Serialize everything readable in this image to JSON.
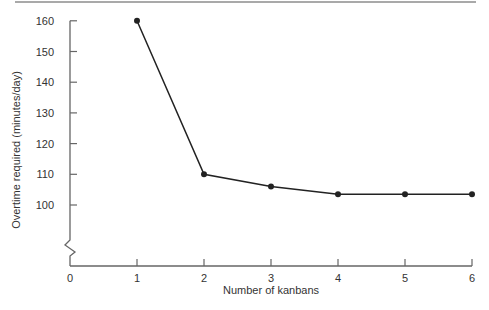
{
  "chart_data": {
    "type": "line",
    "title": "",
    "xlabel": "Number of kanbans",
    "ylabel": "Overtime required (minutes/day)",
    "x": [
      1,
      2,
      3,
      4,
      5,
      6
    ],
    "series": [
      {
        "name": "Overtime required",
        "values": [
          160,
          110,
          106,
          103.5,
          103.5,
          103.5
        ]
      }
    ],
    "x_ticks": [
      "0",
      "1",
      "2",
      "3",
      "4",
      "5",
      "6"
    ],
    "y_ticks": [
      "100",
      "110",
      "120",
      "130",
      "140",
      "150",
      "160"
    ],
    "xlim": [
      0,
      6
    ],
    "ylim": [
      100,
      160
    ],
    "y_axis_break": true,
    "grid": false,
    "legend": "none",
    "markers": "filled-circle",
    "line_color": "#222222"
  }
}
